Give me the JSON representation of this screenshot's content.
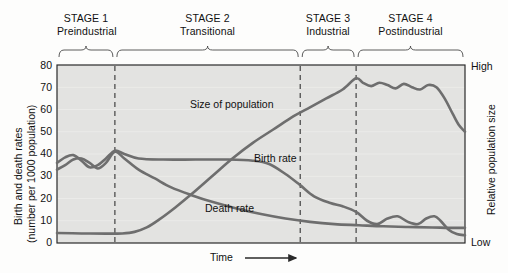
{
  "figure": {
    "background_color": "#fdfdfc",
    "plot_fill_color": "#e3e3e1",
    "curve_color": "#6e6e6e",
    "axis_color": "#2a2a2a",
    "divider_style": "dashed"
  },
  "axes": {
    "left_title_line1": "Birth and death rates",
    "left_title_line2": "(number per 1000 population)",
    "right_title": "Relative population size",
    "x_label": "Time",
    "x_arrow": "⟶",
    "y_ticks": [
      "80",
      "70",
      "60",
      "50",
      "40",
      "30",
      "20",
      "10",
      "0"
    ],
    "right_tick_high": "High",
    "right_tick_low": "Low"
  },
  "stages": [
    {
      "name": "STAGE 1",
      "subtitle": "Preindustrial",
      "x_start_pct": 0,
      "x_end_pct": 14.2
    },
    {
      "name": "STAGE 2",
      "subtitle": "Transitional",
      "x_start_pct": 14.2,
      "x_end_pct": 59.6
    },
    {
      "name": "STAGE 3",
      "subtitle": "Industrial",
      "x_start_pct": 59.6,
      "x_end_pct": 73.3
    },
    {
      "name": "STAGE 4",
      "subtitle": "Postindustrial",
      "x_start_pct": 73.3,
      "x_end_pct": 100
    }
  ],
  "curve_labels": {
    "population": "Size of population",
    "birth_rate": "Birth rate",
    "death_rate": "Death rate"
  },
  "chart_data": {
    "type": "line",
    "xlabel": "Time",
    "ylabel": "Birth and death rates (number per 1000 population)",
    "y2label": "Relative population size",
    "ylim": [
      0,
      80
    ],
    "yticks": [
      0,
      10,
      20,
      30,
      40,
      50,
      60,
      70,
      80
    ],
    "y2ticks": [
      "Low",
      "High"
    ],
    "xlim": [
      0,
      100
    ],
    "grid": false,
    "legend": "inline-annotations",
    "stage_boundaries_pct": [
      14.2,
      59.6,
      73.3
    ],
    "series": [
      {
        "name": "Birth rate",
        "label_position_pct": {
          "x": 48.5,
          "y": 41
        },
        "points": [
          [
            0,
            36
          ],
          [
            2,
            38.5
          ],
          [
            4,
            39.5
          ],
          [
            6,
            37
          ],
          [
            8,
            34
          ],
          [
            10,
            35
          ],
          [
            12,
            38
          ],
          [
            14.2,
            41.5
          ],
          [
            16.5,
            40
          ],
          [
            20,
            38
          ],
          [
            26,
            37.5
          ],
          [
            34,
            37.5
          ],
          [
            42,
            37.5
          ],
          [
            48,
            37
          ],
          [
            52,
            35.5
          ],
          [
            56,
            31
          ],
          [
            59.6,
            26
          ],
          [
            63,
            21
          ],
          [
            67,
            18
          ],
          [
            70,
            16.5
          ],
          [
            73.3,
            14
          ],
          [
            76,
            10
          ],
          [
            78.5,
            8.5
          ],
          [
            81,
            11
          ],
          [
            83.5,
            12
          ],
          [
            86,
            9.5
          ],
          [
            88.5,
            8.5
          ],
          [
            90.5,
            11
          ],
          [
            92.5,
            12
          ],
          [
            94,
            10
          ],
          [
            96,
            6
          ],
          [
            98,
            4
          ],
          [
            100,
            3.5
          ]
        ]
      },
      {
        "name": "Death rate",
        "label_position_pct": {
          "x": 36,
          "y": 15
        },
        "points": [
          [
            0,
            33
          ],
          [
            2,
            35
          ],
          [
            4,
            37.5
          ],
          [
            6,
            38
          ],
          [
            8,
            36
          ],
          [
            10,
            33.5
          ],
          [
            12,
            36
          ],
          [
            14.2,
            41
          ],
          [
            16.5,
            38
          ],
          [
            20,
            33
          ],
          [
            24,
            29
          ],
          [
            28,
            25
          ],
          [
            33,
            21.5
          ],
          [
            38,
            18.5
          ],
          [
            44,
            15.5
          ],
          [
            50,
            13
          ],
          [
            56,
            11
          ],
          [
            62,
            9.5
          ],
          [
            68,
            8.5
          ],
          [
            74,
            8
          ],
          [
            80,
            7.5
          ],
          [
            86,
            7.2
          ],
          [
            92,
            7
          ],
          [
            96,
            6.8
          ],
          [
            100,
            6.8
          ]
        ]
      },
      {
        "name": "Size of population",
        "label_position_pct": {
          "x": 33,
          "y": 63
        },
        "points": [
          [
            0,
            4.5
          ],
          [
            6,
            4.3
          ],
          [
            12,
            4.2
          ],
          [
            16,
            4.3
          ],
          [
            19,
            5
          ],
          [
            22,
            7
          ],
          [
            25,
            10.5
          ],
          [
            29,
            16
          ],
          [
            33,
            22
          ],
          [
            38,
            30
          ],
          [
            43,
            38
          ],
          [
            48,
            45
          ],
          [
            53,
            51
          ],
          [
            58,
            57
          ],
          [
            62,
            61
          ],
          [
            66,
            65
          ],
          [
            70,
            69
          ],
          [
            73.3,
            74
          ],
          [
            75,
            72
          ],
          [
            77,
            70.5
          ],
          [
            79,
            72
          ],
          [
            81,
            71
          ],
          [
            83,
            69.5
          ],
          [
            85,
            71.5
          ],
          [
            87,
            70
          ],
          [
            89,
            69
          ],
          [
            91,
            71
          ],
          [
            93,
            70
          ],
          [
            95,
            65
          ],
          [
            97,
            58
          ],
          [
            98.5,
            53
          ],
          [
            100,
            50
          ]
        ]
      }
    ]
  }
}
